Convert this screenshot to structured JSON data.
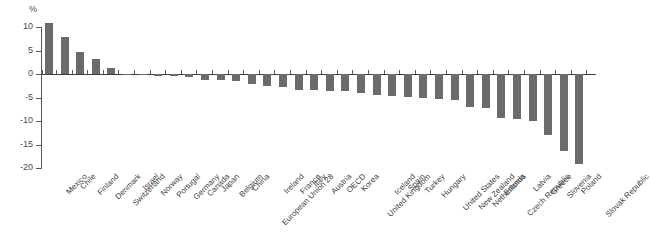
{
  "chart_data": {
    "type": "bar",
    "title": "",
    "subtitle": "",
    "xlabel": "",
    "ylabel": "%",
    "unit_label": "%",
    "ylim": [
      -20,
      11
    ],
    "yticks": [
      10,
      5,
      0,
      -5,
      -10,
      -15,
      -20
    ],
    "ytick_labels": [
      "10",
      "5",
      "0",
      "-5",
      "-10",
      "-15",
      "-20"
    ],
    "grid": false,
    "legend": "none",
    "bar_color": "#6b6b6b",
    "axis_color": "#5a5a5a",
    "categories": [
      "Mexico",
      "Chile",
      "Finland",
      "Denmark",
      "Switzerland",
      "Israel",
      "Norway",
      "Portugal",
      "Germany",
      "Canada",
      "Japan",
      "Belgium",
      "China",
      "European Union 28",
      "Ireland",
      "France",
      "Italy",
      "Austria",
      "OECD",
      "Korea",
      "United Kingdom",
      "Iceland",
      "Spain",
      "Turkey",
      "Hungary",
      "United States",
      "New Zealand",
      "Netherlands",
      "Estonia",
      "Czech Republic",
      "Latvia",
      "Greece",
      "Slovenia",
      "Poland",
      "Slovak Republic"
    ],
    "values": [
      10.8,
      7.9,
      4.7,
      3.1,
      1.3,
      -0.2,
      -0.3,
      -0.4,
      -0.5,
      -0.6,
      -1.2,
      -1.3,
      -1.5,
      -2.1,
      -2.5,
      -2.7,
      -3.3,
      -3.5,
      -3.6,
      -3.7,
      -4.0,
      -4.4,
      -4.6,
      -4.8,
      -5.0,
      -5.3,
      -5.5,
      -7.0,
      -7.2,
      -9.4,
      -9.6,
      -10.0,
      -13.0,
      -16.4,
      -19.2
    ]
  }
}
